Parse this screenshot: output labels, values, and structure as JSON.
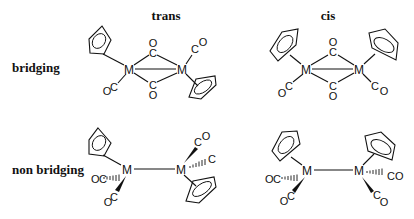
{
  "columns": {
    "trans": "trans",
    "cis": "cis"
  },
  "rows": {
    "bridging": "bridging",
    "non_bridging": "non bridging"
  },
  "atoms": {
    "metal": "M",
    "carbon": "C",
    "oxygen": "O"
  },
  "structures": [
    {
      "id": "trans-bridging",
      "column": "trans",
      "row": "bridging",
      "metals": 2,
      "bridging_co": 2,
      "terminal_co": 2,
      "cp_rings": 2
    },
    {
      "id": "cis-bridging",
      "column": "cis",
      "row": "bridging",
      "metals": 2,
      "bridging_co": 2,
      "terminal_co": 2,
      "cp_rings": 2
    },
    {
      "id": "trans-non-bridging",
      "column": "trans",
      "row": "non bridging",
      "metals": 2,
      "bridging_co": 0,
      "terminal_co": 4,
      "cp_rings": 2
    },
    {
      "id": "cis-non-bridging",
      "column": "cis",
      "row": "non bridging",
      "metals": 2,
      "bridging_co": 0,
      "terminal_co": 4,
      "cp_rings": 2
    }
  ],
  "colors": {
    "ink": "#111111",
    "background": "#ffffff"
  }
}
